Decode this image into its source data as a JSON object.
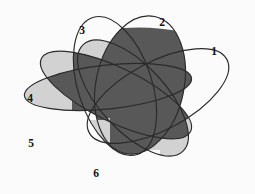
{
  "figure": {
    "background_color": "#fbfbfb",
    "outline_color": "#2a2a2a",
    "dark_fill_color": "#585858",
    "light_fill_color": "#d2d2d2",
    "white_fill_color": "#fbfbfb",
    "set_count": 6,
    "width": 255,
    "height": 194
  },
  "labels": [
    {
      "id": "1",
      "text": "1",
      "x": 214,
      "y": 52
    },
    {
      "id": "2",
      "text": "2",
      "x": 162,
      "y": 23
    },
    {
      "id": "3",
      "text": "3",
      "x": 82,
      "y": 31
    },
    {
      "id": "4",
      "text": "4",
      "x": 30,
      "y": 99
    },
    {
      "id": "5",
      "text": "5",
      "x": 31,
      "y": 144
    },
    {
      "id": "6",
      "text": "6",
      "x": 96,
      "y": 174
    }
  ],
  "ellipses": [
    {
      "id": "1",
      "name": "ellipse-1",
      "cx": 158,
      "cy": 96,
      "rx": 78,
      "ry": 34,
      "rotation": -28
    },
    {
      "id": "2",
      "name": "ellipse-2",
      "cx": 140,
      "cy": 85,
      "rx": 44,
      "ry": 70,
      "rotation": 12
    },
    {
      "id": "3",
      "name": "ellipse-3",
      "cx": 115,
      "cy": 86,
      "rx": 37,
      "ry": 72,
      "rotation": -18
    },
    {
      "id": "4",
      "name": "ellipse-4",
      "cx": 108,
      "cy": 87,
      "rx": 84,
      "ry": 22,
      "rotation": -6
    },
    {
      "id": "5",
      "name": "ellipse-5",
      "cx": 116,
      "cy": 95,
      "rx": 83,
      "ry": 27,
      "rotation": 26
    },
    {
      "id": "6",
      "name": "ellipse-6",
      "cx": 133,
      "cy": 98,
      "rx": 73,
      "ry": 33,
      "rotation": 47
    }
  ],
  "shaded_regions": {
    "dark_description": "Large central union of overlapping interiors, dark gray",
    "light_description": "Left tip of ellipse 4 and lower-central lobe, light gray"
  }
}
